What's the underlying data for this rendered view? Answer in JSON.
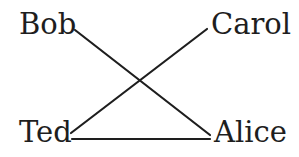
{
  "diagram": {
    "type": "graph",
    "nodes": [
      {
        "id": "bob",
        "label": "Bob"
      },
      {
        "id": "carol",
        "label": "Carol"
      },
      {
        "id": "ted",
        "label": "Ted"
      },
      {
        "id": "alice",
        "label": "Alice"
      }
    ],
    "edges": [
      {
        "from": "Bob",
        "to": "Alice"
      },
      {
        "from": "Carol",
        "to": "Ted"
      },
      {
        "from": "Ted",
        "to": "Alice"
      }
    ],
    "colors": {
      "line": "#1e1e1e",
      "text": "#1e1e1e",
      "background": "#ffffff"
    }
  }
}
